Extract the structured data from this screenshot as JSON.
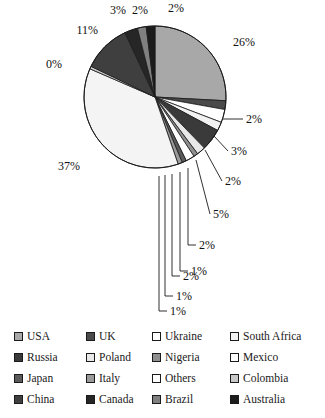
{
  "chart_data": {
    "type": "pie",
    "title": "",
    "xlabel": "",
    "ylabel": "",
    "legend_position": "bottom",
    "grid": false,
    "units": "percent",
    "categories": [
      "USA",
      "UK",
      "Ukraine",
      "South Africa",
      "Russia",
      "Poland",
      "Nigeria",
      "Mexico",
      "Japan",
      "Italy",
      "Others",
      "Colombia",
      "China",
      "Canada",
      "Brazil",
      "Australia"
    ],
    "values": [
      26,
      2,
      3,
      2,
      5,
      2,
      1,
      2,
      1,
      1,
      37,
      0,
      11,
      3,
      2,
      2
    ],
    "labels": [
      "26%",
      "2%",
      "3%",
      "2%",
      "5%",
      "2%",
      "1%",
      "2%",
      "1%",
      "1%",
      "37%",
      "0%",
      "11%",
      "3%",
      "2%",
      "2%"
    ],
    "colors": [
      "#a8a8a8",
      "#4a4a4a",
      "#ffffff",
      "#f2f2f2",
      "#3a3a3a",
      "#e8e8e8",
      "#8f8f8f",
      "#ffffff",
      "#5a5a5a",
      "#9a9a9a",
      "#f4f4f4",
      "#c8c8c8",
      "#3f3f3f",
      "#262626",
      "#808080",
      "#1c1c1c"
    ],
    "slices": [
      {
        "name": "USA",
        "value": 26,
        "label": "26%",
        "color": "#a8a8a8",
        "label_placement": "outside-right"
      },
      {
        "name": "UK",
        "value": 2,
        "label": "2%",
        "color": "#4a4a4a",
        "label_placement": "leader-right"
      },
      {
        "name": "Ukraine",
        "value": 3,
        "label": "3%",
        "color": "#ffffff",
        "label_placement": "leader-right"
      },
      {
        "name": "South Africa",
        "value": 2,
        "label": "2%",
        "color": "#f2f2f2",
        "label_placement": "leader-right"
      },
      {
        "name": "Russia",
        "value": 5,
        "label": "5%",
        "color": "#3a3a3a",
        "label_placement": "leader-right"
      },
      {
        "name": "Poland",
        "value": 2,
        "label": "2%",
        "color": "#e8e8e8",
        "label_placement": "leader-down"
      },
      {
        "name": "Nigeria",
        "value": 1,
        "label": "1%",
        "color": "#8f8f8f",
        "label_placement": "leader-down"
      },
      {
        "name": "Mexico",
        "value": 2,
        "label": "2%",
        "color": "#ffffff",
        "label_placement": "leader-down"
      },
      {
        "name": "Japan",
        "value": 1,
        "label": "1%",
        "color": "#5a5a5a",
        "label_placement": "leader-down"
      },
      {
        "name": "Italy",
        "value": 1,
        "label": "1%",
        "color": "#9a9a9a",
        "label_placement": "leader-down"
      },
      {
        "name": "Others",
        "value": 37,
        "label": "37%",
        "color": "#f4f4f4",
        "label_placement": "outside-left"
      },
      {
        "name": "Colombia",
        "value": 0,
        "label": "0%",
        "color": "#c8c8c8",
        "label_placement": "outside-left"
      },
      {
        "name": "China",
        "value": 11,
        "label": "11%",
        "color": "#3f3f3f",
        "label_placement": "outside-top-left"
      },
      {
        "name": "Canada",
        "value": 3,
        "label": "3%",
        "color": "#262626",
        "label_placement": "outside-top"
      },
      {
        "name": "Brazil",
        "value": 2,
        "label": "2%",
        "color": "#808080",
        "label_placement": "outside-top"
      },
      {
        "name": "Australia",
        "value": 2,
        "label": "2%",
        "color": "#1c1c1c",
        "label_placement": "outside-top"
      }
    ]
  },
  "legend": {
    "columns": 4,
    "rows": 4,
    "entries": [
      {
        "label": "USA",
        "color": "#a8a8a8"
      },
      {
        "label": "UK",
        "color": "#4a4a4a"
      },
      {
        "label": "Ukraine",
        "color": "#ffffff"
      },
      {
        "label": "South Africa",
        "color": "#f2f2f2"
      },
      {
        "label": "Russia",
        "color": "#3a3a3a"
      },
      {
        "label": "Poland",
        "color": "#e8e8e8"
      },
      {
        "label": "Nigeria",
        "color": "#8f8f8f"
      },
      {
        "label": "Mexico",
        "color": "#ffffff"
      },
      {
        "label": "Japan",
        "color": "#5a5a5a"
      },
      {
        "label": "Italy",
        "color": "#9a9a9a"
      },
      {
        "label": "Others",
        "color": "#ffffff"
      },
      {
        "label": "Colombia",
        "color": "#c8c8c8"
      },
      {
        "label": "China",
        "color": "#3f3f3f"
      },
      {
        "label": "Canada",
        "color": "#262626"
      },
      {
        "label": "Brazil",
        "color": "#808080"
      },
      {
        "label": "Australia",
        "color": "#1c1c1c"
      }
    ]
  }
}
